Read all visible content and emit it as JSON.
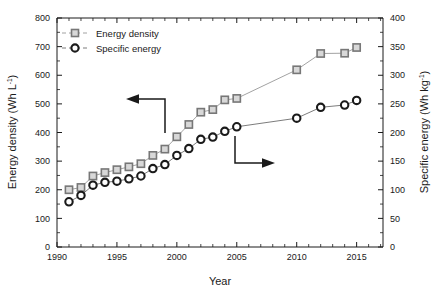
{
  "chart_data": {
    "type": "scatter",
    "title": "",
    "xlabel": "Year",
    "ylabel": "Energy density (Wh L-1)",
    "ylabel_right": "Specific energy (Wh kg-1)",
    "xlim": [
      1990,
      2017.2
    ],
    "ylim": [
      0,
      800
    ],
    "ylim_right": [
      0,
      400
    ],
    "xticks": [
      1990,
      1995,
      2000,
      2005,
      2010,
      2015
    ],
    "xtick_labels": [
      "1990",
      "1995",
      "2000",
      "2005",
      "2010",
      "2015"
    ],
    "xtick_minor_step": 1,
    "yticks": [
      0,
      100,
      200,
      300,
      400,
      500,
      600,
      700,
      800
    ],
    "ytick_labels": [
      "0",
      "100",
      "200",
      "300",
      "400",
      "500",
      "600",
      "700",
      "800"
    ],
    "yticks_right": [
      0,
      50,
      100,
      150,
      200,
      250,
      300,
      350,
      400
    ],
    "ytick_labels_right": [
      "0",
      "50",
      "100",
      "150",
      "200",
      "250",
      "300",
      "350",
      "400"
    ],
    "grid": false,
    "legend_position": "top-left",
    "series": [
      {
        "name": "Energy density",
        "axis": "left",
        "unit": "Wh L-1",
        "marker": "square",
        "marker_fill": "#d8d8d8",
        "marker_stroke": "#777777",
        "line_color": "#8a8a8a",
        "x": [
          1991,
          1992,
          1993,
          1994,
          1995,
          1996,
          1997,
          1998,
          1999,
          2000,
          2001,
          2002,
          2003,
          2004,
          2005,
          2010,
          2012,
          2014,
          2015
        ],
        "y": [
          200,
          208,
          248,
          260,
          270,
          280,
          291,
          320,
          342,
          385,
          428,
          471,
          480,
          514,
          519,
          619,
          676,
          677,
          697
        ]
      },
      {
        "name": "Specific energy",
        "axis": "right",
        "unit": "Wh kg-1",
        "marker": "circle",
        "marker_fill": "#ffffff",
        "marker_stroke": "#1a1a1a",
        "line_color": "#5a5a5a",
        "x": [
          1991,
          1992,
          1993,
          1994,
          1995,
          1996,
          1997,
          1998,
          1999,
          2000,
          2001,
          2002,
          2003,
          2004,
          2005,
          2010,
          2012,
          2014,
          2015
        ],
        "y": [
          79,
          90,
          108,
          113,
          115,
          119,
          124,
          137,
          144,
          160,
          172,
          188,
          192,
          202,
          210,
          225,
          244,
          248,
          256
        ]
      }
    ],
    "annotations": [
      {
        "name": "left-axis-arrow",
        "direction": "left",
        "description": "Elbow arrow pointing to the left axis from the Energy density series"
      },
      {
        "name": "right-axis-arrow",
        "direction": "right",
        "description": "Elbow arrow pointing to the right axis from the Specific energy series"
      }
    ],
    "legend": [
      {
        "label": "Energy density",
        "marker": "square"
      },
      {
        "label": "Specific energy",
        "marker": "circle"
      }
    ]
  },
  "axes": {
    "x_title": "Year",
    "y_left_base": "Energy density (Wh L",
    "y_left_sup": "-1",
    "y_left_tail": ")",
    "y_right_base": "Specific energy (Wh kg",
    "y_right_sup": "-1",
    "y_right_tail": ")"
  },
  "legend": {
    "items": [
      {
        "label": "Energy density"
      },
      {
        "label": "Specific energy"
      }
    ]
  },
  "ticks": {
    "x": [
      "1990",
      "1995",
      "2000",
      "2005",
      "2010",
      "2015"
    ],
    "y_left": [
      "800",
      "700",
      "600",
      "500",
      "400",
      "300",
      "200",
      "100",
      "0"
    ],
    "y_right": [
      "400",
      "350",
      "300",
      "250",
      "200",
      "150",
      "100",
      "50",
      "0"
    ]
  }
}
